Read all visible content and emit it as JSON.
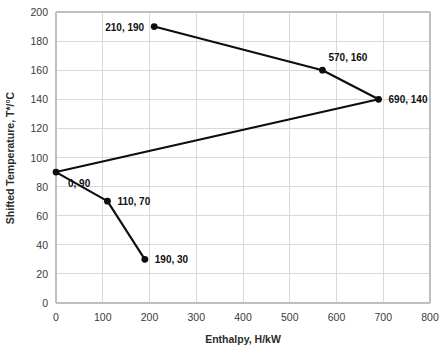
{
  "chart_data": {
    "type": "line",
    "title": "",
    "subtitle": "",
    "xlabel": "Enthalpy, H/kW",
    "ylabel": "Shifted Temperature, T*/°C",
    "xlim": [
      0,
      800
    ],
    "ylim": [
      0,
      200
    ],
    "xticks": [
      0,
      100,
      200,
      300,
      400,
      500,
      600,
      700,
      800
    ],
    "yticks": [
      0,
      20,
      40,
      60,
      80,
      100,
      120,
      140,
      160,
      180,
      200
    ],
    "xtick_labels": [
      "0",
      "100",
      "200",
      "300",
      "400",
      "500",
      "600",
      "700",
      "800"
    ],
    "ytick_labels": [
      "0",
      "20",
      "40",
      "60",
      "80",
      "100",
      "120",
      "140",
      "160",
      "180",
      "200"
    ],
    "grid": true,
    "legend": null,
    "legend_position": "none",
    "series": [
      {
        "name": "Grand composite curve",
        "color": "#0d0d0d",
        "marker": "circle",
        "x": [
          210,
          570,
          690,
          0,
          110,
          190
        ],
        "y": [
          190,
          160,
          140,
          90,
          70,
          30
        ],
        "points": [
          {
            "x": 210,
            "y": 190,
            "label": "210, 190",
            "label_side": "left"
          },
          {
            "x": 570,
            "y": 160,
            "label": "570, 160",
            "label_side": "above-right"
          },
          {
            "x": 690,
            "y": 140,
            "label": "690, 140",
            "label_side": "right"
          },
          {
            "x": 0,
            "y": 90,
            "label": "0, 90",
            "label_side": "below-right"
          },
          {
            "x": 110,
            "y": 70,
            "label": "110, 70",
            "label_side": "right"
          },
          {
            "x": 190,
            "y": 30,
            "label": "190, 30",
            "label_side": "right"
          }
        ]
      }
    ],
    "annotations": [
      "210, 190",
      "570, 160",
      "690, 140",
      "0, 90",
      "110, 70",
      "190, 30"
    ],
    "colors": {
      "series": "#0d0d0d",
      "grid": "#d9d9d9",
      "axis": "#bfbfbf",
      "text": "#2b2b2b",
      "background": "#ffffff"
    }
  }
}
